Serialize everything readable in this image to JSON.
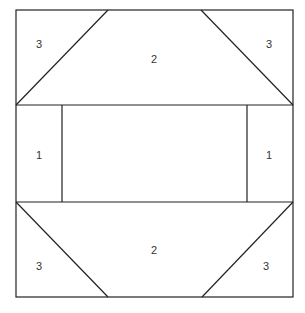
{
  "diagram": {
    "type": "quilt-block-piecing-diagram",
    "line_color": "#222222",
    "regions": [
      {
        "id": "top-left-triangle",
        "label": "3"
      },
      {
        "id": "top-trapezoid",
        "label": "2"
      },
      {
        "id": "top-right-triangle",
        "label": "3"
      },
      {
        "id": "middle-left-rect",
        "label": "1"
      },
      {
        "id": "middle-center-rect",
        "label": ""
      },
      {
        "id": "middle-right-rect",
        "label": "1"
      },
      {
        "id": "bottom-left-triangle",
        "label": "3"
      },
      {
        "id": "bottom-trapezoid",
        "label": "2"
      },
      {
        "id": "bottom-right-triangle",
        "label": "3"
      }
    ]
  }
}
